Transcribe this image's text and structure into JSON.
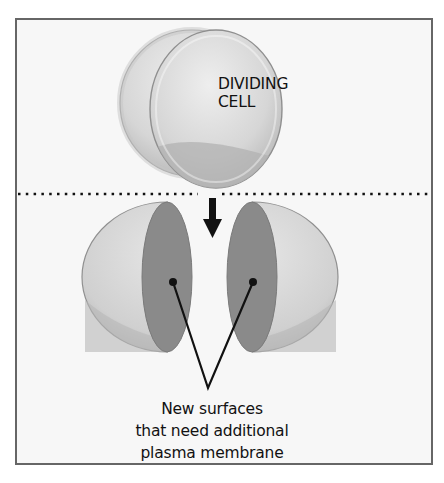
{
  "diagram": {
    "type": "biology-illustration",
    "top_section": {
      "label_line1": "DIVIDING",
      "label_line2": "CELL"
    },
    "divider": "dotted-line",
    "transition_arrow": "down-arrow",
    "bottom_section": {
      "caption_line1": "New surfaces",
      "caption_line2": "that need additional",
      "caption_line3": "plasma membrane"
    },
    "colors": {
      "border": "#666666",
      "background": "#f7f7f7",
      "cell_light": "#d9d9d9",
      "cell_shadow": "#b3b3b3",
      "cut_surface": "#8a8a8a",
      "ink": "#111111"
    }
  }
}
